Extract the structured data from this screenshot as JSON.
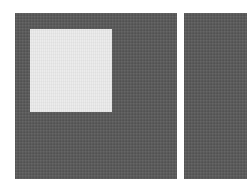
{
  "scene": {
    "background_color": "#ffffff",
    "panels": [
      {
        "id": "left",
        "color": "#5a5a5a",
        "inner_square": {
          "color": "#e4e4e4"
        }
      },
      {
        "id": "right",
        "color": "#5a5a5a"
      }
    ]
  }
}
